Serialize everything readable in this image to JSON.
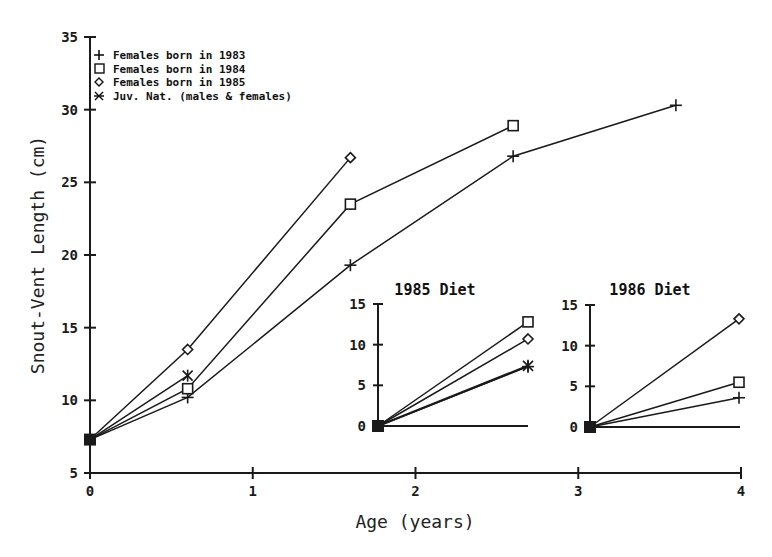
{
  "chart_data": [
    {
      "type": "line",
      "title": "",
      "xlabel": "Age (years)",
      "ylabel": "Snout-Vent Length (cm)",
      "xlim": [
        0,
        4
      ],
      "ylim": [
        5,
        35
      ],
      "x_ticks": [
        "0",
        "1",
        "2",
        "3",
        "4"
      ],
      "y_ticks": [
        "5",
        "10",
        "15",
        "20",
        "25",
        "30",
        "35"
      ],
      "grid": false,
      "legend_position": "top-left",
      "legend": [
        {
          "marker": "plus",
          "symbol": "+",
          "label": "Females born in 1983"
        },
        {
          "marker": "square",
          "symbol": "□",
          "label": "Females born in 1984"
        },
        {
          "marker": "diamond",
          "symbol": "◇",
          "label": "Females born in 1985"
        },
        {
          "marker": "asterisk",
          "symbol": "✱",
          "label": "Juv. Nat. (males & females)"
        }
      ],
      "series": [
        {
          "name": "Females born in 1983",
          "marker": "plus",
          "x": [
            0,
            0.6,
            1.6,
            2.6,
            3.6
          ],
          "y": [
            7.3,
            10.2,
            19.3,
            26.8,
            30.3
          ]
        },
        {
          "name": "Females born in 1984",
          "marker": "square",
          "x": [
            0,
            0.6,
            1.6,
            2.6
          ],
          "y": [
            7.3,
            10.8,
            23.5,
            28.9
          ]
        },
        {
          "name": "Females born in 1985",
          "marker": "diamond",
          "x": [
            0,
            0.6,
            1.6
          ],
          "y": [
            7.3,
            13.5,
            26.7
          ]
        },
        {
          "name": "Juv. Nat. (males & females)",
          "marker": "asterisk",
          "x": [
            0,
            0.6
          ],
          "y": [
            7.3,
            11.7
          ]
        }
      ]
    },
    {
      "type": "line",
      "title": "1985 Diet",
      "inset": true,
      "ylim": [
        0,
        15
      ],
      "y_ticks": [
        "0",
        "5",
        "10",
        "15"
      ],
      "series": [
        {
          "name": "Females born in 1983",
          "marker": "plus",
          "x": [
            0,
            1
          ],
          "y": [
            0,
            7.3
          ]
        },
        {
          "name": "Females born in 1984",
          "marker": "square",
          "x": [
            0,
            1
          ],
          "y": [
            0,
            12.8
          ]
        },
        {
          "name": "Females born in 1985",
          "marker": "diamond",
          "x": [
            0,
            1
          ],
          "y": [
            0,
            10.7
          ]
        },
        {
          "name": "Juv. Nat. (males & females)",
          "marker": "asterisk",
          "x": [
            0,
            1
          ],
          "y": [
            0,
            7.4
          ]
        }
      ]
    },
    {
      "type": "line",
      "title": "1986 Diet",
      "inset": true,
      "ylim": [
        0,
        15
      ],
      "y_ticks": [
        "0",
        "5",
        "10",
        "15"
      ],
      "series": [
        {
          "name": "Females born in 1983",
          "marker": "plus",
          "x": [
            0,
            1
          ],
          "y": [
            0,
            3.6
          ]
        },
        {
          "name": "Females born in 1984",
          "marker": "square",
          "x": [
            0,
            1
          ],
          "y": [
            0,
            5.5
          ]
        },
        {
          "name": "Females born in 1985",
          "marker": "diamond",
          "x": [
            0,
            1
          ],
          "y": [
            0,
            13.3
          ]
        }
      ]
    }
  ],
  "main": {
    "xlabel": "Age (years)",
    "ylabel": "Snout-Vent Length (cm)",
    "x_ticks": [
      "0",
      "1",
      "2",
      "3",
      "4"
    ],
    "y_ticks": [
      "5",
      "10",
      "15",
      "20",
      "25",
      "30",
      "35"
    ]
  },
  "legend": {
    "items": [
      {
        "label": "Females born in 1983"
      },
      {
        "label": "Females born in 1984"
      },
      {
        "label": "Females born in 1985"
      },
      {
        "label": "Juv. Nat. (males & females)"
      }
    ]
  },
  "insets": {
    "diet1985": {
      "title": "1985 Diet",
      "y_ticks": [
        "0",
        "5",
        "10",
        "15"
      ]
    },
    "diet1986": {
      "title": "1986 Diet",
      "y_ticks": [
        "0",
        "5",
        "10",
        "15"
      ]
    }
  },
  "colors": {
    "ink": "#1a1a1a",
    "background": "#ffffff"
  }
}
